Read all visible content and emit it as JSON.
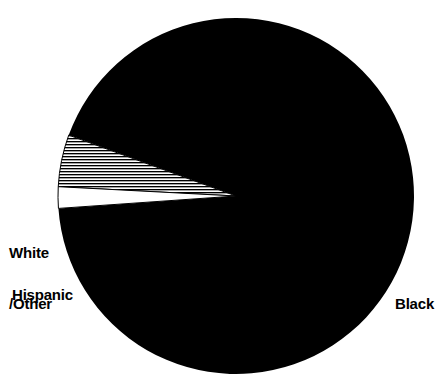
{
  "chart_data": {
    "type": "pie",
    "title": "",
    "subtitle": "",
    "xlabel": "",
    "ylabel": "",
    "legend_position": "none",
    "grid": false,
    "labels_inline": true,
    "categories": [
      "Black",
      "Hispanic",
      "White/Other"
    ],
    "values": [
      88,
      10,
      2
    ],
    "slices": [
      {
        "label": "Black",
        "value": 88,
        "fill_style": "solid-black",
        "color": "#000000",
        "start_angle_deg": 200,
        "end_angle_deg": 536
      },
      {
        "label": "Hispanic",
        "value": 10,
        "fill_style": "horizontal-hatch",
        "color": "#000000",
        "start_angle_deg": 183,
        "end_angle_deg": 200
      },
      {
        "label": "White/Other",
        "value": 2,
        "fill_style": "solid-white-outlined",
        "color": "#ffffff",
        "start_angle_deg": 176,
        "end_angle_deg": 183
      }
    ]
  },
  "geometry": {
    "center_x": 236,
    "center_y": 196,
    "radius": 178
  },
  "labels": {
    "black": "Black",
    "hispanic": "Hispanic",
    "white_other_line1": "White",
    "white_other_line2": "/Other"
  },
  "colors": {
    "background": "#ffffff",
    "ink": "#000000",
    "slice_black": "#000000",
    "slice_white_other": "#ffffff",
    "slice_hispanic_hatch": "#000000"
  }
}
